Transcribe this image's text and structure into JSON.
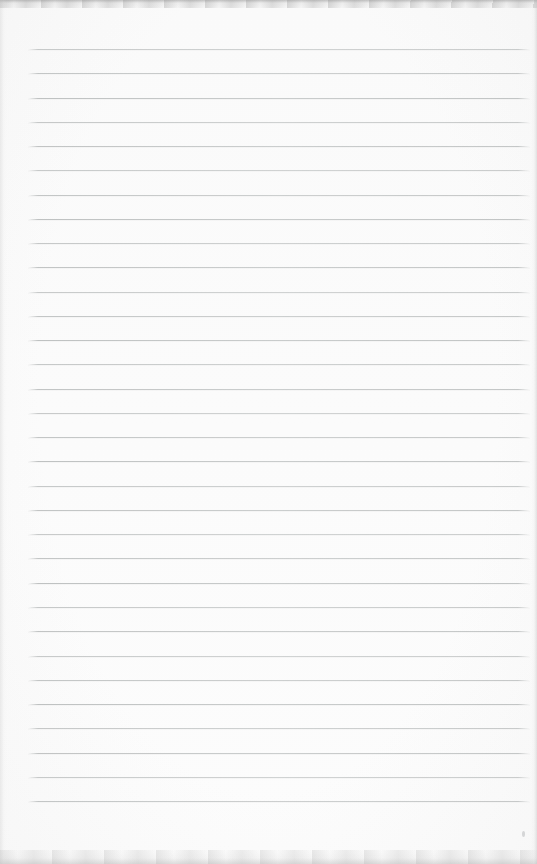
{
  "page": {
    "paper_color": "#fdfdfd",
    "rule_color": "#c4c7c7",
    "edge_shade_color": "#9b9b9b",
    "ruled_lines": {
      "count": 32,
      "first_top_px": 49,
      "spacing_px": 24.26,
      "left_margin_px": 28,
      "right_end_px": 530
    }
  }
}
